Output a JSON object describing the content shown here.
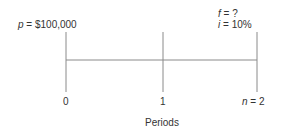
{
  "diagram": {
    "type": "cash-flow-timeline",
    "present_value": {
      "symbol": "p",
      "equals": " = ",
      "value": "$100,000"
    },
    "future_value": {
      "symbol": "f",
      "equals": " = ",
      "value": "?"
    },
    "interest": {
      "symbol": "i",
      "equals": " = ",
      "value": "10%"
    },
    "ticks": [
      {
        "label": "0"
      },
      {
        "label": "1"
      },
      {
        "symbol": "n",
        "equals": " = ",
        "value": "2"
      }
    ],
    "axis_label": "Periods",
    "colors": {
      "line": "#888888",
      "text": "#333333"
    }
  }
}
